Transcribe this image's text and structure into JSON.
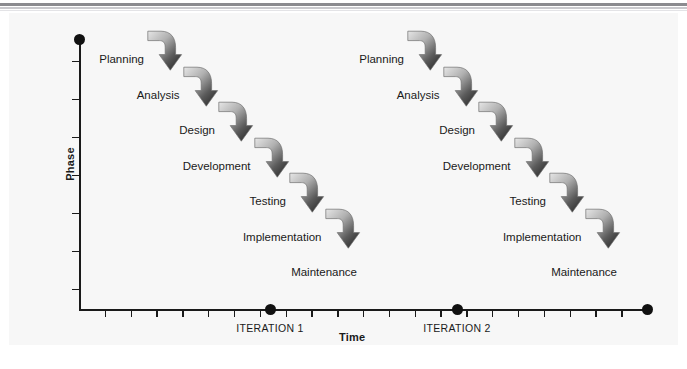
{
  "figure": {
    "type": "diagram",
    "title": ""
  },
  "axes": {
    "y_title": "Phase",
    "x_title": "Time",
    "y_tick_count": 7,
    "x_tick_count": 21,
    "y_axis_has_end_dot": true
  },
  "iterations": [
    {
      "id": "iteration-1",
      "label": "ITERATION 1",
      "marker_x": 261,
      "steps": [
        {
          "name": "Planning",
          "label": "Planning"
        },
        {
          "name": "Analysis",
          "label": "Analysis"
        },
        {
          "name": "Design",
          "label": "Design"
        },
        {
          "name": "Development",
          "label": "Development"
        },
        {
          "name": "Testing",
          "label": "Testing"
        },
        {
          "name": "Implementation",
          "label": "Implementation"
        },
        {
          "name": "Maintenance",
          "label": "Maintenance"
        }
      ]
    },
    {
      "id": "iteration-2",
      "label": "ITERATION 2",
      "marker_x": 448,
      "steps": [
        {
          "name": "Planning",
          "label": "Planning"
        },
        {
          "name": "Analysis",
          "label": "Analysis"
        },
        {
          "name": "Design",
          "label": "Design"
        },
        {
          "name": "Development",
          "label": "Development"
        },
        {
          "name": "Testing",
          "label": "Testing"
        },
        {
          "name": "Implementation",
          "label": "Implementation"
        },
        {
          "name": "Maintenance",
          "label": "Maintenance"
        }
      ]
    }
  ],
  "colors": {
    "panel_background": "#f7f7f7",
    "page_background": "#ffffff",
    "axis": "#1a1a1a",
    "text": "#1a1a1a",
    "arrow_light": "#e6e6e6",
    "arrow_dark": "#2b2b2b",
    "rule_dark": "#8b8b8f",
    "rule_light": "#c9c9cd"
  }
}
